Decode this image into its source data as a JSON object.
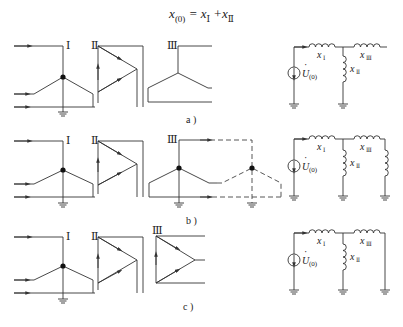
{
  "formula": {
    "lhs": "x",
    "lhs_sub": "(0)",
    "eq": " = x",
    "t1_sub": "Ⅰ",
    "plus": " +x",
    "t2_sub": "Ⅱ"
  },
  "windings": {
    "I": "Ⅰ",
    "II": "Ⅱ",
    "III": "Ⅲ"
  },
  "circuit_labels": {
    "x1": "x",
    "x1_sub": "Ⅰ",
    "x2": "x",
    "x2_sub": "Ⅱ",
    "x3": "x",
    "x3_sub": "Ⅲ",
    "source": "U",
    "source_sub": "(0)",
    "source_dot": "·"
  },
  "captions": {
    "a": "a )",
    "b": "b )",
    "c": "c )"
  },
  "rows": [
    {
      "id": "a",
      "description": "Three-winding transformer YN/d/y — zero-sequence equivalent: x(0) = xI + xII; xIII branch open"
    },
    {
      "id": "b",
      "description": "Three-winding transformer YN/d/yn with grounded external load — xIII branch connected to ground through load reactance"
    },
    {
      "id": "c",
      "description": "Three-winding transformer YN/d/d — xIII branch grounded directly"
    }
  ],
  "colors": {
    "line": "#333333",
    "background": "#ffffff"
  }
}
